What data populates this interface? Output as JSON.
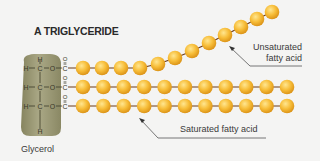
{
  "title": "A TRIGLYCERIDE",
  "labels": {
    "glycerol": "Glycerol",
    "unsaturated_line1": "Unsaturated",
    "unsaturated_line2": "fatty acid",
    "saturated": "Saturated fatty acid"
  },
  "glycerol_rows": [
    {
      "h": "H",
      "c": "C",
      "o": "O",
      "carbonyl_o": "O",
      "carbonyl_c": "C"
    },
    {
      "h": "H",
      "c": "C",
      "o": "O",
      "carbonyl_o": "O",
      "carbonyl_c": "C"
    },
    {
      "h": "H",
      "c": "C",
      "o": "O",
      "carbonyl_o": "O",
      "carbonyl_c": "C"
    }
  ],
  "glycerol_top_h": "H",
  "glycerol_bottom_h": "H",
  "colors": {
    "bead": "#f5b935",
    "bead_highlight": "#ffe08a",
    "bead_shadow": "#d9951a",
    "bond": "#6b3a1a",
    "glycerol": "#9c9a78",
    "text": "#3a3a3a",
    "background": "#f4f4f3"
  },
  "chains": {
    "unsaturated_beads": 13,
    "saturated_top_beads": 11,
    "saturated_bottom_beads": 11
  }
}
